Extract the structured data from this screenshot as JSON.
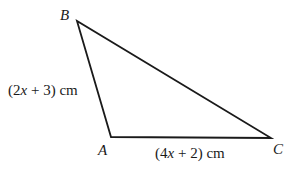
{
  "figure": {
    "type": "triangle",
    "vertices": [
      {
        "name": "B",
        "x": 77,
        "y": 21
      },
      {
        "name": "A",
        "x": 111,
        "y": 137
      },
      {
        "name": "C",
        "x": 271,
        "y": 138
      }
    ],
    "labels": {
      "B": "B",
      "A": "A",
      "C": "C"
    },
    "side_AB": {
      "pre": "(2",
      "var": "x",
      "post": " + 3) cm"
    },
    "side_AC": {
      "pre": "(4",
      "var": "x",
      "post": " + 2) cm"
    },
    "stroke_color": "#1a1a1a"
  }
}
